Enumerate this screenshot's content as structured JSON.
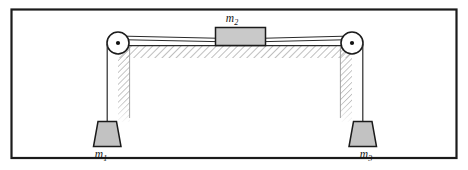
{
  "figure": {
    "kind": "physics-free-body-diagram",
    "frame": {
      "border_color": "#1b1b1b",
      "background_color": "#ffffff"
    },
    "labels": {
      "m1": {
        "base": "m",
        "subscript": "1"
      },
      "m2": {
        "base": "m",
        "subscript": "2"
      },
      "m3": {
        "base": "m",
        "subscript": "3"
      }
    },
    "colors": {
      "line": "#1b1b1b",
      "block_fill": "#c9c9c9",
      "weight_fill": "#c2c2c2",
      "hatch": "#8a8a8a",
      "string": "#3a3a3a",
      "pulley_fill": "#ffffff",
      "axle_fill": "#111111"
    },
    "parts": {
      "table_label": "table-surface",
      "left_pulley_label": "left-pulley",
      "right_pulley_label": "right-pulley",
      "block_label": "block-m2",
      "left_weight_label": "hanging-weight-m1",
      "right_weight_label": "hanging-weight-m3",
      "left_string_label": "string-left",
      "right_string_label": "string-right"
    }
  }
}
